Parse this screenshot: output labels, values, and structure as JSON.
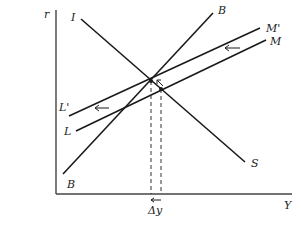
{
  "diagram": {
    "type": "IS-LM-BP shift diagram",
    "axes": {
      "y_label": "r",
      "x_label": "Y"
    },
    "curves": [
      {
        "name": "I",
        "label": "I",
        "end_label": "S",
        "description": "IS curve, downward sloping"
      },
      {
        "name": "B",
        "label_top": "B",
        "label_bottom": "B",
        "description": "BP curve, steep upward sloping"
      },
      {
        "name": "M_prime",
        "label_start": "L'",
        "label_end": "M'",
        "description": "shifted LM curve"
      },
      {
        "name": "M",
        "label_start": "L",
        "label_end": "M",
        "description": "original LM curve"
      }
    ],
    "annotations": {
      "delta_label": "Δy",
      "shift_direction": "left"
    },
    "colors": {
      "line": "#1a1a1a",
      "axis": "#444444",
      "background": "#ffffff"
    }
  }
}
